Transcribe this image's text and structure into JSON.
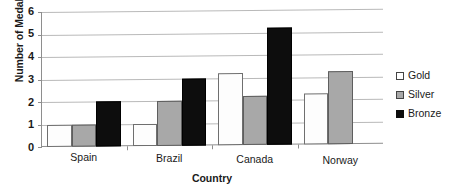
{
  "chart_data": {
    "type": "bar",
    "title": "",
    "xlabel": "Country",
    "ylabel": "Number of Medals Won",
    "categories": [
      "Spain",
      "Brazil",
      "Canada",
      "Norway"
    ],
    "series": [
      {
        "name": "Gold",
        "color": "#ffffff",
        "values": [
          1,
          1,
          3.2,
          2.25
        ]
      },
      {
        "name": "Silver",
        "color": "#a8a8a8",
        "values": [
          1,
          2,
          2.2,
          3.25
        ]
      },
      {
        "name": "Bronze",
        "color": "#0d0d0d",
        "values": [
          2,
          3,
          5.2,
          0
        ]
      }
    ],
    "ylim": [
      0,
      6
    ],
    "yticks": [
      0,
      1,
      2,
      3,
      4,
      5,
      6
    ],
    "ytick_labels": [
      "0",
      "1",
      "2",
      "3",
      "4",
      "5",
      "6"
    ],
    "grid": true,
    "grid_axis": "y",
    "legend_position": "right",
    "bar_layout": "grouped"
  }
}
